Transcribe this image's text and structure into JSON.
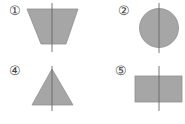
{
  "figures": [
    {
      "label": "①",
      "shape": "trapezoid",
      "has_axis": true
    },
    {
      "label": "②",
      "shape": "circle",
      "has_axis": true
    },
    {
      "label": "④",
      "shape": "triangle",
      "has_axis": true
    },
    {
      "label": "⑤",
      "shape": "rectangle",
      "has_axis": true
    }
  ],
  "colors": {
    "fill": "#a6a6a6",
    "stroke": "#8a8a8a",
    "axis": "#666666"
  }
}
